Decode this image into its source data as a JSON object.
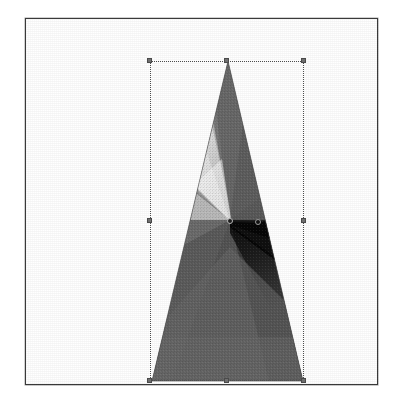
{
  "canvas": {
    "label": "Artboard",
    "background_color": "#ffffff",
    "border_color": "#3a3a3a",
    "frame": {
      "x": 25,
      "y": 18,
      "width": 353,
      "height": 367
    }
  },
  "shape": {
    "name": "triangle",
    "label": "Triangle",
    "points_label": "Apex, Base Left, Base Right",
    "apex": {
      "x": 78,
      "y": 0
    },
    "base_left": {
      "x": 2,
      "y": 320
    },
    "base_right": {
      "x": 153,
      "y": 320
    },
    "fill_type": "angle-gradient",
    "fill_label": "Angle Gradient"
  },
  "gradient": {
    "type": "conic",
    "label": "Angle Gradient",
    "origin": {
      "x": 204,
      "y": 201
    },
    "end": {
      "x": 232,
      "y": 202
    },
    "angle_degrees": 0,
    "stops": [
      {
        "position": 0,
        "color": "#111111",
        "label": "Black"
      },
      {
        "position": 0.16,
        "color": "#2a2a2a",
        "label": "Near Black"
      },
      {
        "position": 0.34,
        "color": "#565656",
        "label": "Dark Gray"
      },
      {
        "position": 0.52,
        "color": "#6a6a6a",
        "label": "Mid Gray"
      },
      {
        "position": 0.7,
        "color": "#9f9f9f",
        "label": "Light Gray"
      },
      {
        "position": 0.8,
        "color": "#f4f4f4",
        "label": "White"
      },
      {
        "position": 0.88,
        "color": "#767676",
        "label": "Gray"
      },
      {
        "position": 1.0,
        "color": "#111111",
        "label": "Black"
      }
    ]
  },
  "selection": {
    "label": "Selection Bounding Box",
    "x": 124,
    "y": 42,
    "width": 154,
    "height": 320,
    "handle_color": "#6f6f6f",
    "outline_color": "#4d4d4d",
    "handles": [
      {
        "name": "handle-top-left",
        "label": "Top Left",
        "x": 0,
        "y": 0
      },
      {
        "name": "handle-top-center",
        "label": "Top Center",
        "x": 77,
        "y": 0
      },
      {
        "name": "handle-top-right",
        "label": "Top Right",
        "x": 154,
        "y": 0
      },
      {
        "name": "handle-middle-left",
        "label": "Middle Left",
        "x": 0,
        "y": 160
      },
      {
        "name": "handle-middle-right",
        "label": "Middle Right",
        "x": 154,
        "y": 160
      },
      {
        "name": "handle-bottom-left",
        "label": "Bottom Left",
        "x": 0,
        "y": 320
      },
      {
        "name": "handle-bottom-center",
        "label": "Bottom Center",
        "x": 77,
        "y": 320
      },
      {
        "name": "handle-bottom-right",
        "label": "Bottom Right",
        "x": 154,
        "y": 320
      }
    ]
  },
  "accessibility": {
    "canvas_description": "White artboard with a thin dark border containing a tall narrow triangle filled with an angle gradient, shown selected with a dotted bounding box and gradient axis handles."
  }
}
